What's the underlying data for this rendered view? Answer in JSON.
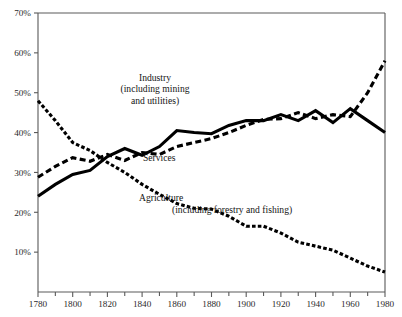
{
  "chart_data": {
    "type": "line",
    "title": "",
    "subtitle": "",
    "xlabel": "",
    "ylabel": "",
    "xlim": [
      1780,
      1980
    ],
    "ylim": [
      0,
      70
    ],
    "grid": false,
    "legend_position": "inline-annotations",
    "y_tick_labels": [
      "70%",
      "60%",
      "50%",
      "40%",
      "30%",
      "20%",
      "10%"
    ],
    "y_tick_values": [
      70,
      60,
      50,
      40,
      30,
      20,
      10
    ],
    "x_tick_labels": [
      "1780",
      "1800",
      "1820",
      "1840",
      "1860",
      "1880",
      "1900",
      "1920",
      "1940",
      "1960",
      "1980"
    ],
    "x_tick_values": [
      1780,
      1800,
      1820,
      1840,
      1860,
      1880,
      1900,
      1920,
      1940,
      1960,
      1980
    ],
    "x_minor_tick_values": [
      1790,
      1810,
      1830,
      1850,
      1870,
      1890,
      1910,
      1930,
      1950,
      1970
    ],
    "x": [
      1780,
      1790,
      1800,
      1810,
      1820,
      1830,
      1840,
      1850,
      1860,
      1870,
      1880,
      1890,
      1900,
      1910,
      1920,
      1930,
      1940,
      1950,
      1960,
      1970,
      1980
    ],
    "series": [
      {
        "name": "Industry (including mining and utilities)",
        "style": "solid",
        "values": [
          24,
          27,
          29.5,
          30.5,
          34,
          36,
          34.3,
          36.5,
          40.5,
          40,
          39.7,
          41.8,
          43,
          43,
          44.5,
          43,
          45.5,
          42.5,
          46,
          43,
          40
        ]
      },
      {
        "name": "Services",
        "style": "dashed",
        "values": [
          28.8,
          31.5,
          33.7,
          32.8,
          34.5,
          33,
          35,
          34.5,
          36.5,
          37.5,
          38.5,
          40,
          41.8,
          43.3,
          43.5,
          45,
          43.5,
          44.5,
          44,
          50,
          58
        ]
      },
      {
        "name": "Agriculture (including forestry and fishing)",
        "style": "dotted-thick",
        "values": [
          48,
          43,
          37.5,
          35.5,
          32.5,
          30,
          27,
          24.5,
          22.2,
          21,
          20.8,
          19,
          16.5,
          16.5,
          14.8,
          12.5,
          11.5,
          10.5,
          8.5,
          6.5,
          5
        ]
      }
    ],
    "annotations": [
      {
        "name": "industry-label",
        "lines": [
          "Industry",
          "(including mining",
          "and utilities)"
        ],
        "text": "Industry\n(including mining\nand utilities)"
      },
      {
        "name": "services-label",
        "lines": [
          "Services"
        ],
        "text": "Services"
      },
      {
        "name": "agriculture-label",
        "lines": [
          "Agriculture"
        ],
        "text": "Agriculture"
      },
      {
        "name": "agriculture-sub-label",
        "lines": [
          "(including forestry and fishing)"
        ],
        "text": "(including forestry and fishing)"
      }
    ],
    "colors": {
      "line": "#000000",
      "axis": "#5a5a5a",
      "text": "#141414",
      "background": "#ffffff"
    }
  }
}
